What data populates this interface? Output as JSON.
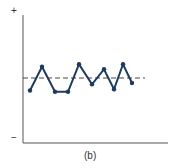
{
  "chart_data": {
    "type": "line",
    "title": "",
    "caption": "(b)",
    "xlabel": "",
    "ylabel": "",
    "y_top_label": "+",
    "y_bottom_label": "−",
    "grid": false,
    "reference_line": {
      "style": "dashed",
      "value": 0
    },
    "x": [
      1,
      2,
      3,
      4,
      5,
      6,
      7,
      8,
      9,
      10
    ],
    "series": [
      {
        "name": "series",
        "values": [
          -0.5,
          0.45,
          -0.55,
          -0.55,
          0.55,
          -0.25,
          0.35,
          -0.45,
          0.55,
          -0.2
        ],
        "color": "#1f3a5f"
      }
    ],
    "ylim": [
      -2,
      2
    ]
  }
}
